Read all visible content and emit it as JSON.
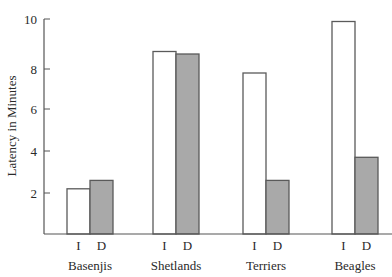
{
  "chart_data": {
    "type": "bar",
    "title": "",
    "xlabel": "",
    "ylabel": "Latency in Minutes",
    "ylim": [
      0,
      10
    ],
    "yticks": [
      2,
      4,
      6,
      8,
      10
    ],
    "grid": false,
    "legend": null,
    "categories": [
      "Basenjis",
      "Shetlands",
      "Terriers",
      "Beagles"
    ],
    "condition_labels": [
      "I",
      "D"
    ],
    "series": [
      {
        "name": "I",
        "color": "#ffffff",
        "values": [
          2.2,
          8.7,
          7.8,
          9.9
        ]
      },
      {
        "name": "D",
        "color": "#a9a9a9",
        "values": [
          2.6,
          8.6,
          2.6,
          3.7
        ]
      }
    ]
  },
  "colors": {
    "axis": "#555555",
    "bar_outline": "#5a5a5a",
    "bar_I": "#ffffff",
    "bar_D": "#a9a9a9",
    "text": "#2a2a2a"
  }
}
